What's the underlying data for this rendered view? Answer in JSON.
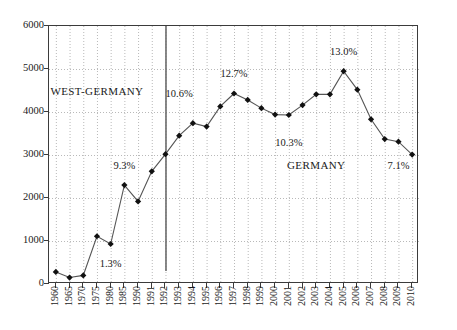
{
  "chart_data": {
    "type": "line",
    "title": "",
    "xlabel": "",
    "ylabel": "",
    "ylim": [
      0,
      6000
    ],
    "y_ticks": [
      0,
      1000,
      2000,
      3000,
      4000,
      5000,
      6000
    ],
    "grid": true,
    "legend": "none",
    "categories": [
      "1960",
      "1965",
      "1970",
      "1975",
      "1980",
      "1985",
      "1990",
      "1991",
      "1992",
      "1993",
      "1994",
      "1995",
      "1996",
      "1997",
      "1998",
      "1999",
      "2000",
      "2001",
      "2002",
      "2003",
      "2004",
      "2005",
      "2006",
      "2007",
      "2008",
      "2009",
      "2010"
    ],
    "values": [
      280,
      150,
      200,
      1110,
      930,
      2300,
      1920,
      2620,
      3020,
      3450,
      3740,
      3660,
      4130,
      4430,
      4280,
      4090,
      3940,
      3930,
      4160,
      4410,
      4410,
      4950,
      4520,
      3830,
      3370,
      3310,
      3010
    ],
    "series": [
      {
        "name": "series-1",
        "values": [
          280,
          150,
          200,
          1110,
          930,
          2300,
          1920,
          2620,
          3020,
          3450,
          3740,
          3660,
          4130,
          4430,
          4280,
          4090,
          3940,
          3930,
          4160,
          4410,
          4410,
          4950,
          4520,
          3830,
          3370,
          3310,
          3010
        ]
      }
    ],
    "marker": "diamond",
    "line_color": "#555555",
    "marker_color": "#111111",
    "grid_color": "#b9b9b9",
    "frame_color": "#3b3b3b",
    "divider": {
      "at_category": "1992",
      "color": "#6b6b6b",
      "name": "reunification-divider"
    },
    "region_labels": [
      {
        "text": "WEST-GERMANY",
        "at_category": "1975",
        "at_value": 4480
      },
      {
        "text": "GERMANY",
        "at_category": "2003",
        "at_value": 2760
      }
    ],
    "point_annotations": [
      {
        "text": "1.3%",
        "at_category": "1980",
        "at_value": 490
      },
      {
        "text": "9.3%",
        "at_category": "1985",
        "at_value": 2770
      },
      {
        "text": "10.6%",
        "at_category": "1993",
        "at_value": 4440
      },
      {
        "text": "12.7%",
        "at_category": "1997",
        "at_value": 4910
      },
      {
        "text": "10.3%",
        "at_category": "2001",
        "at_value": 3310
      },
      {
        "text": "13.0%",
        "at_category": "2005",
        "at_value": 5430
      },
      {
        "text": "7.1%",
        "at_category": "2009",
        "at_value": 2760
      }
    ]
  }
}
